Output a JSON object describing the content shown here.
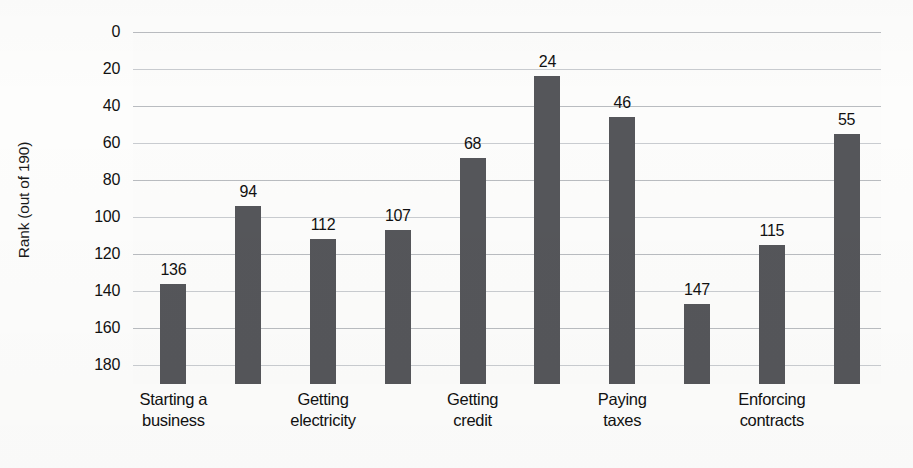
{
  "chart_data": {
    "type": "bar",
    "title": "",
    "subtitle": "",
    "xlabel": "",
    "ylabel": "Rank (out of 190)",
    "ylim": [
      0,
      190
    ],
    "y_inverted": true,
    "grid": true,
    "legend": null,
    "bar_color": "#55565a",
    "gridline_color": "#b9bcc0",
    "background_color": "#fcfcfb",
    "y_ticks": [
      0,
      20,
      40,
      60,
      80,
      100,
      120,
      140,
      160,
      180
    ],
    "categories": [
      "Starting a business",
      "Dealing with construction permits",
      "Getting electricity",
      "Registering property",
      "Getting credit",
      "Protecting minority investors",
      "Paying taxes",
      "Trading across borders",
      "Enforcing contracts",
      "Resolving insolvency"
    ],
    "values": [
      136,
      94,
      112,
      107,
      68,
      24,
      46,
      147,
      115,
      55
    ],
    "visible_x_tick_labels": [
      {
        "index": 0,
        "line1": "Starting a",
        "line2": "business"
      },
      {
        "index": 2,
        "line1": "Getting",
        "line2": "electricity"
      },
      {
        "index": 4,
        "line1": "Getting",
        "line2": "credit"
      },
      {
        "index": 6,
        "line1": "Paying",
        "line2": "taxes"
      },
      {
        "index": 8,
        "line1": "Enforcing",
        "line2": "contracts"
      }
    ],
    "bars": [
      {
        "value": 136,
        "label": "136"
      },
      {
        "value": 94,
        "label": "94"
      },
      {
        "value": 112,
        "label": "112"
      },
      {
        "value": 107,
        "label": "107"
      },
      {
        "value": 68,
        "label": "68"
      },
      {
        "value": 24,
        "label": "24"
      },
      {
        "value": 46,
        "label": "46"
      },
      {
        "value": 147,
        "label": "147"
      },
      {
        "value": 115,
        "label": "115"
      },
      {
        "value": 55,
        "label": "55"
      }
    ]
  },
  "axis": {
    "y_title": "Rank (out of 190)",
    "y_tick_labels": [
      "0",
      "20",
      "40",
      "60",
      "80",
      "100",
      "120",
      "140",
      "160",
      "180"
    ]
  },
  "x_axis_labels": [
    {
      "line1": "Starting a",
      "line2": "business"
    },
    {
      "line1": "Getting",
      "line2": "electricity"
    },
    {
      "line1": "Getting",
      "line2": "credit"
    },
    {
      "line1": "Paying",
      "line2": "taxes"
    },
    {
      "line1": "Enforcing",
      "line2": "contracts"
    }
  ]
}
